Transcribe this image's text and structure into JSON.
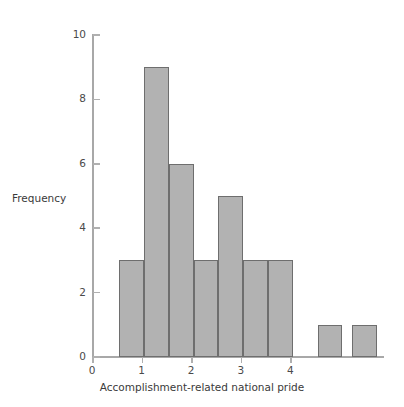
{
  "chart_data": {
    "type": "bar",
    "title": "",
    "subtitle": "",
    "xlabel": "Accomplishment-related national pride",
    "ylabel": "Frequency",
    "xlim": [
      0,
      4.6
    ],
    "ylim": [
      0,
      10
    ],
    "grid": false,
    "legend": null,
    "bin_width": 0.5,
    "x_ticks": [
      0,
      1,
      2,
      3,
      4
    ],
    "x_tick_labels": [
      "0",
      "1",
      "2",
      "3",
      "4"
    ],
    "y_ticks": [
      0,
      2,
      4,
      6,
      8,
      10
    ],
    "y_tick_labels": [
      "0",
      "2",
      "4",
      "6",
      "8",
      "10"
    ],
    "bar_color": "#b2b2b2",
    "bar_edge_color": "#6e6e6e",
    "axis_color": "#a8a8a8",
    "bins": [
      {
        "left": 0.55,
        "right": 1.05,
        "value": 3
      },
      {
        "left": 1.05,
        "right": 1.55,
        "value": 9
      },
      {
        "left": 1.55,
        "right": 2.05,
        "value": 6
      },
      {
        "left": 2.05,
        "right": 2.55,
        "value": 3
      },
      {
        "left": 2.55,
        "right": 3.05,
        "value": 5
      },
      {
        "left": 3.05,
        "right": 3.55,
        "value": 3
      },
      {
        "left": 3.55,
        "right": 4.05,
        "value": 3
      },
      {
        "left": 4.55,
        "right": 5.05,
        "value": 1
      },
      {
        "left": 5.25,
        "right": 5.75,
        "value": 1
      }
    ],
    "categories": [
      "0.55",
      "1.05",
      "1.55",
      "2.05",
      "2.55",
      "3.05",
      "3.55",
      "4.55",
      "5.25"
    ],
    "values": [
      3,
      9,
      6,
      3,
      5,
      3,
      3,
      1,
      1
    ]
  },
  "geometry": {
    "x_px_per_unit": 49.6,
    "y_px_per_unit": 32.2,
    "origin_x_px": 92,
    "origin_y_px": 357,
    "plot_height_px": 322
  }
}
